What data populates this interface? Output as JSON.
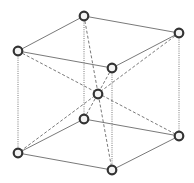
{
  "diagram": {
    "colors": {
      "background": "#ffffff",
      "edge": "#6a6a6a",
      "atom_stroke": "#333333",
      "atom_fill": "#f4f4f4"
    },
    "atoms": [
      {
        "id": "top-back-left",
        "x": 84,
        "y": 16
      },
      {
        "id": "top-back-right",
        "x": 179,
        "y": 33
      },
      {
        "id": "top-front-left",
        "x": 18,
        "y": 51
      },
      {
        "id": "top-front-right",
        "x": 112,
        "y": 68
      },
      {
        "id": "body-center",
        "x": 98,
        "y": 94
      },
      {
        "id": "bottom-back-left",
        "x": 84,
        "y": 119
      },
      {
        "id": "bottom-back-right",
        "x": 179,
        "y": 136
      },
      {
        "id": "bottom-front-left",
        "x": 18,
        "y": 153
      },
      {
        "id": "bottom-front-right",
        "x": 112,
        "y": 170
      }
    ],
    "edges": {
      "solid": [
        [
          "top-back-left",
          "top-back-right"
        ],
        [
          "top-back-left",
          "top-front-left"
        ],
        [
          "top-front-left",
          "top-front-right"
        ],
        [
          "top-front-right",
          "top-back-right"
        ],
        [
          "bottom-back-left",
          "bottom-back-right"
        ],
        [
          "bottom-back-left",
          "bottom-front-left"
        ],
        [
          "bottom-front-left",
          "bottom-front-right"
        ],
        [
          "bottom-front-right",
          "bottom-back-right"
        ]
      ],
      "dotted_vertical": [
        [
          "top-back-left",
          "bottom-back-left"
        ],
        [
          "top-back-right",
          "bottom-back-right"
        ],
        [
          "top-front-left",
          "bottom-front-left"
        ],
        [
          "top-front-right",
          "bottom-front-right"
        ]
      ],
      "dashed_body_diagonals": [
        [
          "top-back-left",
          "bottom-front-right"
        ],
        [
          "top-back-right",
          "bottom-front-left"
        ],
        [
          "top-front-left",
          "bottom-back-right"
        ],
        [
          "top-front-right",
          "bottom-back-left"
        ]
      ]
    }
  }
}
